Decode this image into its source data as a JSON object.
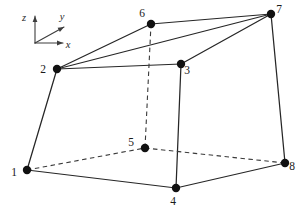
{
  "figure": {
    "background_color": "#ffffff",
    "line_color": "#262626",
    "dashed_line_color": "#3a3a3a",
    "node_color": "#111111",
    "axis_color": "#3c3c3c",
    "width": 305,
    "height": 211
  },
  "axis_triad": {
    "origin": {
      "x": 35,
      "y": 43
    },
    "axes": [
      {
        "name": "z",
        "label": "z",
        "tip_x": 35,
        "tip_y": 16,
        "label_x": 24,
        "label_y": 21,
        "direction": "up"
      },
      {
        "name": "y",
        "label": "y",
        "tip_x": 64,
        "tip_y": 27,
        "label_x": 62,
        "label_y": 20,
        "direction": "up-right"
      },
      {
        "name": "x",
        "label": "x",
        "tip_x": 63,
        "tip_y": 43,
        "label_x": 68,
        "label_y": 48,
        "direction": "right"
      }
    ]
  },
  "nodes": [
    {
      "id": "1",
      "x": 27,
      "y": 170,
      "label": "1",
      "label_x": 14,
      "label_y": 176
    },
    {
      "id": "2",
      "x": 57,
      "y": 69,
      "label": "2",
      "label_x": 43,
      "label_y": 73
    },
    {
      "id": "3",
      "x": 181,
      "y": 64,
      "label": "3",
      "label_x": 187,
      "label_y": 74
    },
    {
      "id": "4",
      "x": 176,
      "y": 188,
      "label": "4",
      "label_x": 173,
      "label_y": 205
    },
    {
      "id": "5",
      "x": 145,
      "y": 148,
      "label": "5",
      "label_x": 131,
      "label_y": 146
    },
    {
      "id": "6",
      "x": 151,
      "y": 24,
      "label": "6",
      "label_x": 142,
      "label_y": 17
    },
    {
      "id": "7",
      "x": 271,
      "y": 14,
      "label": "7",
      "label_x": 279,
      "label_y": 13
    },
    {
      "id": "8",
      "x": 285,
      "y": 163,
      "label": "8",
      "label_x": 292,
      "label_y": 170
    }
  ],
  "edges": [
    {
      "from": "1",
      "to": "2",
      "style": "solid",
      "name": "edge-1-2"
    },
    {
      "from": "2",
      "to": "3",
      "style": "solid",
      "name": "edge-2-3"
    },
    {
      "from": "3",
      "to": "4",
      "style": "solid",
      "name": "edge-3-4"
    },
    {
      "from": "4",
      "to": "1",
      "style": "solid",
      "name": "edge-4-1"
    },
    {
      "from": "2",
      "to": "6",
      "style": "solid",
      "name": "edge-2-6"
    },
    {
      "from": "2",
      "to": "7",
      "style": "solid",
      "name": "edge-2-7"
    },
    {
      "from": "6",
      "to": "7",
      "style": "solid",
      "name": "edge-6-7"
    },
    {
      "from": "3",
      "to": "7",
      "style": "solid",
      "name": "edge-3-7"
    },
    {
      "from": "7",
      "to": "8",
      "style": "solid",
      "name": "edge-7-8"
    },
    {
      "from": "4",
      "to": "8",
      "style": "solid",
      "name": "edge-4-8"
    },
    {
      "from": "1",
      "to": "5",
      "style": "dashed",
      "name": "edge-1-5"
    },
    {
      "from": "5",
      "to": "8",
      "style": "dashed",
      "name": "edge-5-8"
    },
    {
      "from": "5",
      "to": "6",
      "style": "dashed",
      "name": "edge-5-6"
    }
  ],
  "node_dot_radius": 4.2
}
